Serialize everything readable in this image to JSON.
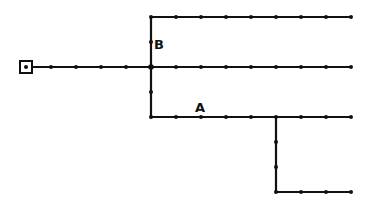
{
  "diagram": {
    "type": "grid-path-network",
    "colors": {
      "line": "#111111",
      "background": "#ffffff"
    },
    "start_marker": {
      "x": 26,
      "y": 67,
      "shape": "square-with-dot"
    },
    "labels": [
      {
        "id": "B",
        "text": "B",
        "x": 154,
        "y": 49
      },
      {
        "id": "A",
        "text": "A",
        "x": 195,
        "y": 112
      }
    ],
    "segments": [
      {
        "id": "main-stem",
        "x1": 26,
        "y1": 67,
        "x2": 151,
        "y2": 67
      },
      {
        "id": "trunk-vertical",
        "x1": 151,
        "y1": 17,
        "x2": 151,
        "y2": 117
      },
      {
        "id": "top-branch",
        "x1": 151,
        "y1": 17,
        "x2": 351,
        "y2": 17
      },
      {
        "id": "middle-branch",
        "x1": 151,
        "y1": 67,
        "x2": 351,
        "y2": 67
      },
      {
        "id": "lower-branch",
        "x1": 151,
        "y1": 117,
        "x2": 351,
        "y2": 117
      },
      {
        "id": "drop-vertical",
        "x1": 276,
        "y1": 117,
        "x2": 276,
        "y2": 192
      },
      {
        "id": "bottom-branch",
        "x1": 276,
        "y1": 192,
        "x2": 351,
        "y2": 192
      }
    ],
    "node_spacing": 25
  }
}
